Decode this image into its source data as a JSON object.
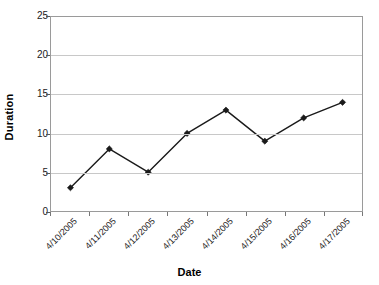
{
  "chart_data": {
    "type": "line",
    "title": "",
    "xlabel": "Date",
    "ylabel": "Duration",
    "categories": [
      "4/10/2005",
      "4/11/2005",
      "4/12/2005",
      "4/13/2005",
      "4/14/2005",
      "4/15/2005",
      "4/16/2005",
      "4/17/2005"
    ],
    "values": [
      3,
      8,
      5,
      10,
      13,
      9,
      12,
      14
    ],
    "series": [
      {
        "name": "Duration",
        "values": [
          3,
          8,
          5,
          10,
          13,
          9,
          12,
          14
        ],
        "color": "#1a1a1a",
        "marker": "diamond"
      }
    ],
    "ylim": [
      0,
      25
    ],
    "ytick_values": [
      0,
      5,
      10,
      15,
      20,
      25
    ],
    "ytick_labels": [
      "0",
      "5",
      "10",
      "15",
      "20",
      "25"
    ],
    "grid": "horizontal",
    "legend": "none",
    "plot_background": "#ffffff",
    "gridline_color": "#c8c8c8",
    "border_color": "#9a9a9a"
  }
}
